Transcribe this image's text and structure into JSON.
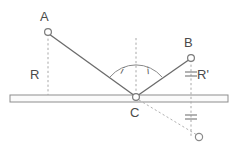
{
  "figure": {
    "type": "optics-reflection-diagram",
    "background_color": "#ffffff",
    "stroke_color": "#6b6b6b",
    "dash_color": "#9a9a9a",
    "label_color": "#4a4a4a",
    "width": 235,
    "height": 153
  },
  "labels": {
    "point_a": "A",
    "point_b": "B",
    "point_c": "C",
    "normal_left": "R",
    "normal_right": "R'",
    "angle_incidence": "i",
    "angle_reflection": "i"
  },
  "points": {
    "a": {
      "name": "A",
      "x": 48,
      "y": 32
    },
    "b": {
      "name": "B",
      "x": 191,
      "y": 58
    },
    "c": {
      "name": "C",
      "x": 136,
      "y": 97
    },
    "image": {
      "name": "image-of-b",
      "x": 199,
      "y": 137
    }
  },
  "mirror": {
    "name": "plane-mirror",
    "x1": 10,
    "x2": 228,
    "y": 95,
    "thickness": 7
  },
  "rays": {
    "incident": {
      "from": "A",
      "to": "C",
      "style": "solid"
    },
    "reflected": {
      "from": "C",
      "to": "B",
      "style": "solid"
    },
    "virtual": {
      "from": "C",
      "to": "image-of-b",
      "style": "dashed"
    }
  },
  "construction_lines": {
    "normal": {
      "label": "normal",
      "x": 136,
      "y_top": 38,
      "y_bottom": 97,
      "style": "dashed"
    },
    "vertical_a": {
      "label": "A-perpendicular",
      "x": 48,
      "y_top": 34,
      "y_bottom": 95,
      "style": "dashed"
    },
    "vertical_b": {
      "label": "B-perpendicular",
      "x": 191,
      "y_top": 60,
      "y_bottom": 137,
      "style": "dashed"
    }
  },
  "tick_marks": [
    {
      "name": "equal-distance-tick-upper",
      "x": 191,
      "y": 74
    },
    {
      "name": "equal-distance-tick-lower",
      "x": 191,
      "y": 117
    }
  ],
  "angle_arc": {
    "name": "angle-arc",
    "center_x": 136,
    "center_y": 97,
    "radius": 34
  }
}
